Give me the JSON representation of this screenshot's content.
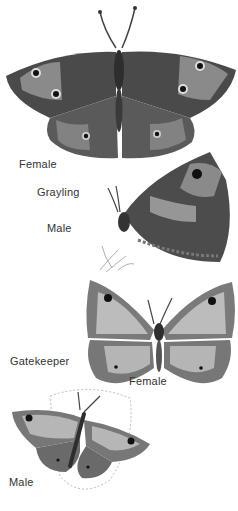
{
  "plate": {
    "labels": {
      "grayling_female": "Female",
      "grayling_species": "Grayling",
      "grayling_male": "Male",
      "gatekeeper_species": "Gatekeeper",
      "gatekeeper_female": "Female",
      "gatekeeper_male": "Male"
    },
    "footer_text": "",
    "colors": {
      "background": "#ffffff",
      "wing_dark": "#3a3a3a",
      "wing_mid": "#6e6e6e",
      "wing_light": "#b8b8b8",
      "eyespot": "#111111"
    }
  }
}
